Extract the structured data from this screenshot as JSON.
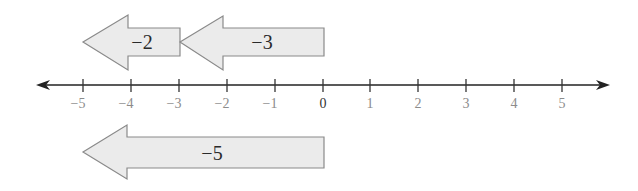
{
  "diagram": {
    "type": "number-line-addition",
    "number_line": {
      "min": -5,
      "max": 5,
      "ticks": [
        "−5",
        "−4",
        "−3",
        "−2",
        "−1",
        "0",
        "1",
        "2",
        "3",
        "4",
        "5"
      ]
    },
    "arrows": [
      {
        "label": "−2",
        "from": -3,
        "to": -5,
        "row": "top"
      },
      {
        "label": "−3",
        "from": 0,
        "to": -3,
        "row": "top"
      },
      {
        "label": "−5",
        "from": 0,
        "to": -5,
        "row": "bottom"
      }
    ]
  }
}
